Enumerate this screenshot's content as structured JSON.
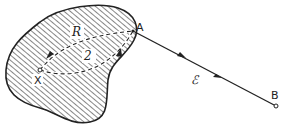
{
  "diagram": {
    "points": {
      "A": "A",
      "B": "B",
      "X": "X"
    },
    "paths": {
      "R": "R",
      "two": "2",
      "E": "ℰ"
    },
    "colors": {
      "stroke": "#222222",
      "fill_hatch": "#222222",
      "background": "#ffffff"
    }
  }
}
